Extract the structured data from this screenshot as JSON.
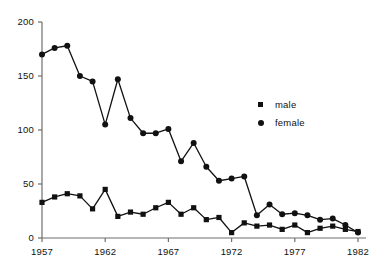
{
  "chart_data": {
    "type": "line",
    "title": "",
    "subtitle": "",
    "xlabel": "",
    "ylabel": "",
    "xlim": [
      1956.5,
      1982.5
    ],
    "ylim": [
      0,
      200
    ],
    "grid": false,
    "legend_position": "center-right",
    "x_ticks": [
      1957,
      1962,
      1967,
      1972,
      1977,
      1982
    ],
    "x_tick_labels": [
      "1957",
      "1962",
      "1967",
      "1972",
      "1977",
      "1982"
    ],
    "y_ticks": [
      0,
      50,
      100,
      150,
      200
    ],
    "y_tick_labels": [
      "0",
      "50",
      "100",
      "150",
      "200"
    ],
    "x": [
      1957,
      1958,
      1959,
      1960,
      1961,
      1962,
      1963,
      1964,
      1965,
      1966,
      1967,
      1968,
      1969,
      1970,
      1971,
      1972,
      1973,
      1974,
      1975,
      1976,
      1977,
      1978,
      1979,
      1980,
      1981,
      1982
    ],
    "series": [
      {
        "name": "male",
        "marker": "square",
        "color": "#111111",
        "values": [
          33,
          38,
          41,
          39,
          27,
          45,
          20,
          24,
          22,
          28,
          33,
          22,
          28,
          17,
          19,
          5,
          14,
          11,
          12,
          8,
          12,
          5,
          9,
          11,
          8,
          6
        ]
      },
      {
        "name": "female",
        "marker": "circle",
        "color": "#111111",
        "values": [
          170,
          176,
          178,
          150,
          145,
          105,
          147,
          111,
          97,
          97,
          101,
          71,
          88,
          66,
          53,
          55,
          57,
          21,
          31,
          22,
          23,
          21,
          17,
          18,
          12,
          5
        ]
      }
    ]
  },
  "legend": {
    "items": [
      {
        "label": "male",
        "marker": "square-marker-icon"
      },
      {
        "label": "female",
        "marker": "circle-marker-icon"
      }
    ]
  }
}
